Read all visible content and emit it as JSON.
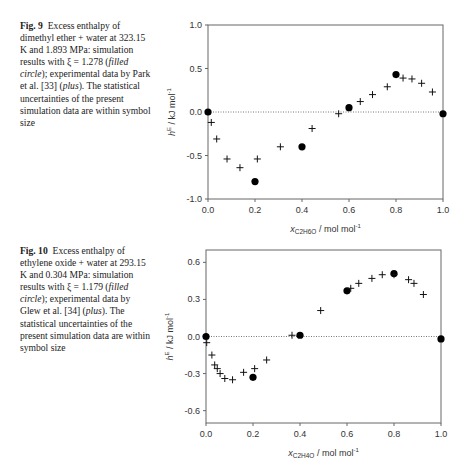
{
  "figures": [
    {
      "label": "Fig. 9",
      "caption_parts": [
        {
          "t": "Excess enthalpy of dimethyl ether + water at 323.15 K and 1.893 MPa: simulation results with ξ = 1.278 ("
        },
        {
          "t": "filled circle",
          "i": true
        },
        {
          "t": "); experimental data by Park et al. [33] ("
        },
        {
          "t": "plus",
          "i": true
        },
        {
          "t": "). The statistical uncertainties of the present simulation data are within symbol size"
        }
      ]
    },
    {
      "label": "Fig. 10",
      "caption_parts": [
        {
          "t": "Excess enthalpy of ethylene oxide + water at 293.15 K and 0.304 MPa: simulation results with ξ = 1.179 ("
        },
        {
          "t": "filled circle",
          "i": true
        },
        {
          "t": "); experimental data by Glew et al. [34] ("
        },
        {
          "t": "plus",
          "i": true
        },
        {
          "t": "). The statistical uncertainties of the present simulation data are within symbol size"
        }
      ]
    }
  ],
  "chart_data": [
    {
      "type": "scatter",
      "title": "Fig. 9",
      "xlabel": "x_C2H6O / mol mol^-1",
      "xlabel_main": "x",
      "xlabel_sub": "C2H6O",
      "xlabel_unit": " / mol mol",
      "ylabel": "h^E / kJ mol^-1",
      "xlim": [
        0,
        1
      ],
      "ylim": [
        -1,
        1
      ],
      "xticks": [
        "0.0",
        "0.2",
        "0.4",
        "0.6",
        "0.8",
        "1.0"
      ],
      "yticks": [
        "-1.0",
        "-0.5",
        "0.0",
        "0.5",
        "1.0"
      ],
      "ytick_values": [
        -1,
        -0.5,
        0,
        0.5,
        1
      ],
      "zero_line": true,
      "box": {
        "left": 208,
        "right": 443,
        "top": 25,
        "bottom": 199
      },
      "series": [
        {
          "name": "simulation (filled circle)",
          "marker": "circle",
          "x": [
            0.0,
            0.2,
            0.4,
            0.6,
            0.8,
            1.0
          ],
          "y": [
            0.0,
            -0.8,
            -0.4,
            0.05,
            0.43,
            -0.02
          ]
        },
        {
          "name": "experimental, Park et al. [33] (plus)",
          "marker": "plus",
          "x": [
            0.014,
            0.037,
            0.081,
            0.136,
            0.21,
            0.308,
            0.443,
            0.556,
            0.648,
            0.7,
            0.763,
            0.83,
            0.868,
            0.909,
            0.955
          ],
          "y": [
            -0.12,
            -0.31,
            -0.54,
            -0.64,
            -0.54,
            -0.4,
            -0.19,
            -0.02,
            0.12,
            0.2,
            0.29,
            0.39,
            0.38,
            0.33,
            0.23
          ]
        }
      ]
    },
    {
      "type": "scatter",
      "title": "Fig. 10",
      "xlabel": "x_C2H4O / mol mol^-1",
      "xlabel_main": "x",
      "xlabel_sub": "C2H4O",
      "xlabel_unit": " / mol mol",
      "ylabel": "h^E / kJ mol^-1",
      "xlim": [
        0,
        1
      ],
      "ylim": [
        -0.7,
        0.7
      ],
      "xticks": [
        "0.0",
        "0.2",
        "0.4",
        "0.6",
        "0.8",
        "1.0"
      ],
      "yticks": [
        "-0.6",
        "-0.3",
        "0.0",
        "0.3",
        "0.6"
      ],
      "ytick_values": [
        -0.6,
        -0.3,
        0,
        0.3,
        0.6
      ],
      "zero_line": true,
      "box": {
        "left": 206,
        "right": 441,
        "top": 250,
        "bottom": 423
      },
      "series": [
        {
          "name": "simulation (filled circle)",
          "marker": "circle",
          "x": [
            0.0,
            0.2,
            0.4,
            0.6,
            0.8,
            1.0
          ],
          "y": [
            0.0,
            -0.33,
            0.01,
            0.37,
            0.51,
            -0.02
          ]
        },
        {
          "name": "experimental, Glew et al. [34] (plus)",
          "marker": "plus",
          "x": [
            0.003,
            0.025,
            0.037,
            0.048,
            0.06,
            0.08,
            0.113,
            0.16,
            0.207,
            0.258,
            0.366,
            0.488,
            0.616,
            0.65,
            0.706,
            0.75,
            0.8,
            0.862,
            0.885,
            0.925
          ],
          "y": [
            -0.05,
            -0.15,
            -0.23,
            -0.26,
            -0.3,
            -0.34,
            -0.35,
            -0.29,
            -0.26,
            -0.19,
            0.01,
            0.21,
            0.39,
            0.43,
            0.47,
            0.5,
            0.5,
            0.46,
            0.43,
            0.34
          ]
        }
      ]
    }
  ]
}
